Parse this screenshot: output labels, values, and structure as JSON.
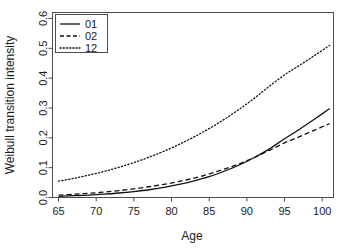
{
  "chart_data": {
    "type": "line",
    "title": "",
    "xlabel": "Age",
    "ylabel": "Weibull transition intensity",
    "xlim": [
      64.2,
      101.5
    ],
    "ylim": [
      0.0,
      0.62
    ],
    "grid": false,
    "legend_position": "top-left",
    "xticks": [
      65,
      70,
      75,
      80,
      85,
      90,
      95,
      100
    ],
    "xtick_labels": [
      "65",
      "70",
      "75",
      "80",
      "85",
      "90",
      "95",
      "100"
    ],
    "yticks": [
      0.0,
      0.1,
      0.2,
      0.3,
      0.4,
      0.5,
      0.6
    ],
    "ytick_labels": [
      "0.0",
      "0.1",
      "0.2",
      "0.3",
      "0.4",
      "0.5",
      "0.6"
    ],
    "x": [
      65,
      67,
      69,
      71,
      73,
      75,
      77,
      79,
      81,
      83,
      85,
      87,
      89,
      91,
      93,
      95,
      97,
      99,
      101
    ],
    "series": [
      {
        "name": "01",
        "style": "solid",
        "color": "#111111",
        "values": [
          0.004,
          0.006,
          0.008,
          0.011,
          0.015,
          0.02,
          0.026,
          0.034,
          0.044,
          0.056,
          0.07,
          0.088,
          0.109,
          0.134,
          0.163,
          0.197,
          0.229,
          0.263,
          0.298
        ]
      },
      {
        "name": "02",
        "style": "dashed",
        "color": "#111111",
        "values": [
          0.008,
          0.011,
          0.014,
          0.018,
          0.023,
          0.029,
          0.036,
          0.044,
          0.054,
          0.065,
          0.079,
          0.095,
          0.113,
          0.134,
          0.158,
          0.183,
          0.204,
          0.226,
          0.248
        ]
      },
      {
        "name": "12",
        "style": "dotted",
        "color": "#111111",
        "values": [
          0.055,
          0.064,
          0.075,
          0.087,
          0.101,
          0.117,
          0.135,
          0.155,
          0.178,
          0.203,
          0.231,
          0.262,
          0.296,
          0.333,
          0.373,
          0.411,
          0.443,
          0.476,
          0.51
        ]
      }
    ]
  },
  "legend": {
    "entries": [
      {
        "label": "01"
      },
      {
        "label": "02"
      },
      {
        "label": "12"
      }
    ]
  }
}
